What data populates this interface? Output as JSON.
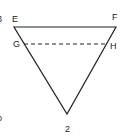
{
  "figure": {
    "caption_number": "2",
    "shape": "inverted-triangle",
    "vertices": {
      "top_left": {
        "label": "E"
      },
      "top_right": {
        "label": "F"
      },
      "bottom": {
        "label": ""
      }
    },
    "dashed_line": {
      "left_label": "G",
      "right_label": "H"
    },
    "cropped_fragments": [
      "3",
      "b"
    ],
    "colors": {
      "line": "#222222",
      "background": "#ffffff"
    }
  }
}
